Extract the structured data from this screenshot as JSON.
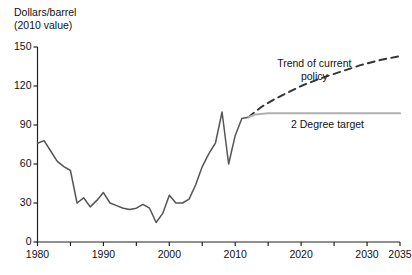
{
  "chart_data": {
    "type": "line",
    "title": "",
    "ylabel_line1": "Dollars/barrel",
    "ylabel_line2": "(2010 value)",
    "xlabel": "",
    "xlim": [
      1980,
      2035
    ],
    "ylim": [
      0,
      150
    ],
    "yticks": [
      0,
      30,
      60,
      90,
      120,
      150
    ],
    "ytick_labels": [
      "0",
      "30",
      "60",
      "90",
      "120",
      "150"
    ],
    "xticks": [
      1980,
      1985,
      1990,
      1995,
      2000,
      2005,
      2010,
      2015,
      2020,
      2025,
      2030,
      2035
    ],
    "xtick_labels": [
      {
        "x": 1980,
        "label": "1980"
      },
      {
        "x": 1990,
        "label": "1990"
      },
      {
        "x": 2000,
        "label": "2000"
      },
      {
        "x": 2010,
        "label": "2010"
      },
      {
        "x": 2020,
        "label": "2020"
      },
      {
        "x": 2030,
        "label": "2030"
      },
      {
        "x": 2035,
        "label": "2035"
      }
    ],
    "grid": false,
    "legend_position": "inline-annotations",
    "series": [
      {
        "name": "Historical oil price",
        "style": "solid",
        "color": "#555555",
        "x": [
          1980,
          1981,
          1982,
          1983,
          1984,
          1985,
          1986,
          1987,
          1988,
          1989,
          1990,
          1991,
          1992,
          1993,
          1994,
          1995,
          1996,
          1997,
          1998,
          1999,
          2000,
          2001,
          2002,
          2003,
          2004,
          2005,
          2006,
          2007,
          2008,
          2009,
          2010,
          2011,
          2012
        ],
        "values": [
          76,
          78,
          70,
          62,
          58,
          55,
          30,
          34,
          27,
          32,
          38,
          30,
          28,
          26,
          25,
          26,
          29,
          26,
          15,
          22,
          36,
          30,
          30,
          33,
          44,
          58,
          68,
          76,
          100,
          60,
          82,
          95,
          96
        ]
      },
      {
        "name": "Trend of current policy",
        "style": "dashed",
        "color": "#333333",
        "x": [
          2012,
          2014,
          2016,
          2018,
          2020,
          2023,
          2026,
          2029,
          2032,
          2035
        ],
        "values": [
          96,
          104,
          110,
          115,
          120,
          126,
          131,
          136,
          140,
          143
        ]
      },
      {
        "name": "2 Degree target",
        "style": "solid",
        "color": "#b0b0b0",
        "x": [
          2012,
          2013,
          2015,
          2018,
          2022,
          2028,
          2035
        ],
        "values": [
          96,
          98,
          99,
          99,
          99,
          99,
          99
        ]
      }
    ],
    "annotations": [
      {
        "name": "trend-of-current-policy-label",
        "text_line1": "Trend of current",
        "text_line2": "policy",
        "x": 2022,
        "y": 137
      },
      {
        "name": "two-degree-target-label",
        "text_line1": "2 Degree target",
        "text_line2": "",
        "x": 2024,
        "y": 90
      }
    ]
  }
}
